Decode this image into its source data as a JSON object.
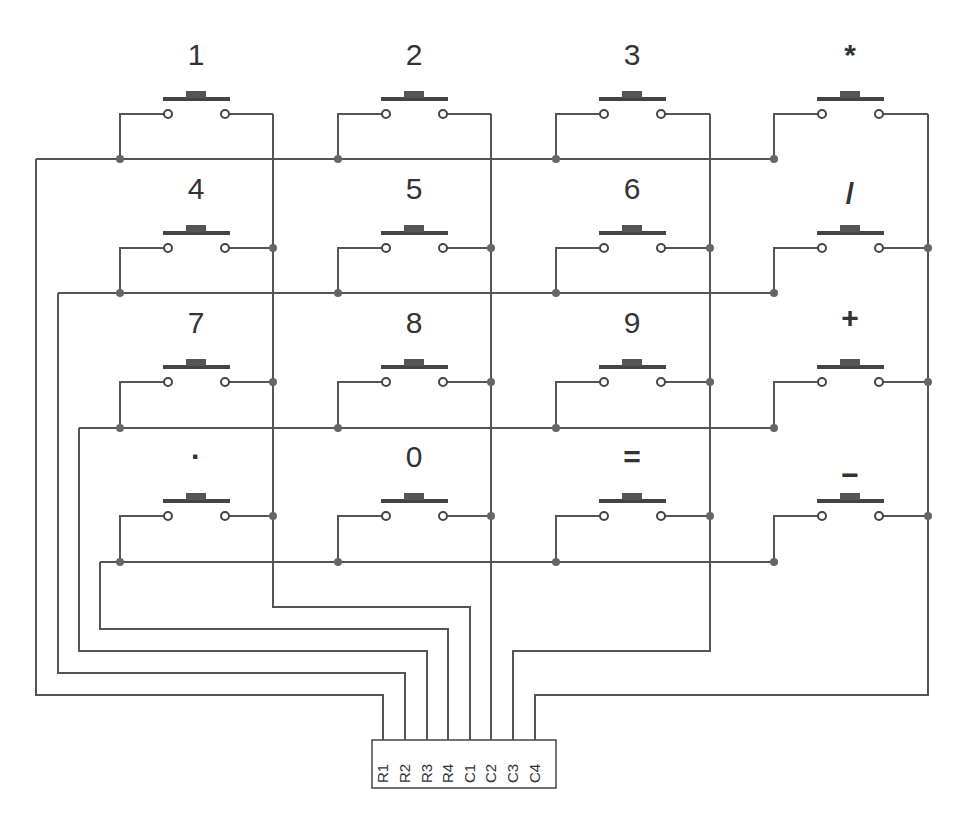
{
  "diagram": {
    "type": "4x4 matrix keypad schematic",
    "keys": [
      [
        "1",
        "2",
        "3",
        "*"
      ],
      [
        "4",
        "5",
        "6",
        "/"
      ],
      [
        "7",
        "8",
        "9",
        "+"
      ],
      [
        "·",
        "0",
        "=",
        "−"
      ]
    ],
    "connector": {
      "pins": [
        "R1",
        "R2",
        "R3",
        "R4",
        "C1",
        "C2",
        "C3",
        "C4"
      ]
    },
    "colors": {
      "wire": "#555555",
      "switch": "#444444",
      "text": "#333333",
      "background": "#ffffff"
    }
  }
}
